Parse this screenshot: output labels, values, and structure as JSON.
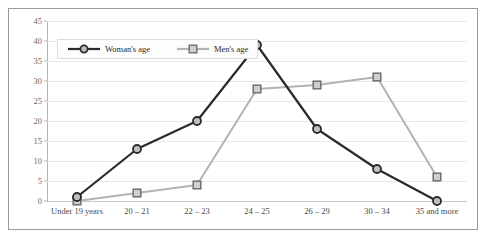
{
  "chart_data": {
    "type": "line",
    "title": "",
    "xlabel": "",
    "ylabel": "",
    "ylim": [
      0,
      45
    ],
    "ytick_step": 5,
    "yticks": [
      45,
      40,
      35,
      30,
      25,
      20,
      15,
      10,
      5,
      0
    ],
    "grid": true,
    "legend_position": "top-left inside plot area",
    "categories": [
      "Under 19 years",
      "20 – 21",
      "22 – 23",
      "24 – 25",
      "26 – 29",
      "30 – 34",
      "35 and more"
    ],
    "series": [
      {
        "name": "Woman's age",
        "values": [
          1,
          13,
          20,
          39,
          18,
          8,
          0
        ],
        "color": "#2b2b2b",
        "marker": "circle",
        "marker_fill": "#bfbfbf"
      },
      {
        "name": "Men's age",
        "values": [
          0,
          2,
          4,
          28,
          29,
          31,
          6
        ],
        "color": "#b3b3b3",
        "marker": "square",
        "marker_fill": "#d0d0d0"
      }
    ]
  },
  "legend": {
    "items": [
      {
        "label": "Woman's age"
      },
      {
        "label": "Men's age"
      }
    ]
  },
  "colors": {
    "frame_border": "#9a9a9a",
    "gridline": "#e8e8e8",
    "axis": "#b4b4b4",
    "tick_text": "#6b6b6b",
    "category_text": "#4a4a4a",
    "background": "#ffffff"
  }
}
